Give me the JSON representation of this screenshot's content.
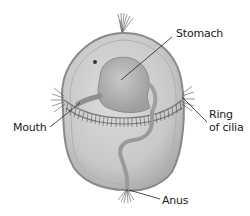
{
  "diagram": {
    "labels": {
      "stomach": "Stomach",
      "ring_line1": "Ring",
      "ring_line2": "of cilia",
      "mouth": "Mouth",
      "anus": "Anus"
    },
    "colors": {
      "body_fill": "#c9c9c9",
      "body_edge": "#8a8a8a",
      "stomach_fill": "#b5b5b5",
      "cilia": "#555555",
      "leader_line": "#222222",
      "text": "#1a1a1a"
    }
  }
}
